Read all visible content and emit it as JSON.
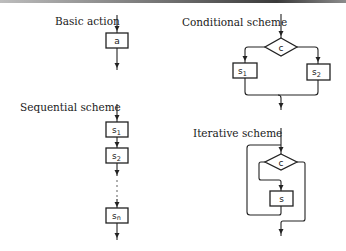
{
  "diagram": {
    "basic_action": {
      "title": "Basic action",
      "box_label": "a"
    },
    "conditional_scheme": {
      "title": "Conditional scheme",
      "condition_label": "c",
      "left_box": {
        "base": "s",
        "sub": "1"
      },
      "right_box": {
        "base": "s",
        "sub": "2"
      }
    },
    "sequential_scheme": {
      "title": "Sequential scheme",
      "boxes": [
        {
          "base": "s",
          "sub": "1"
        },
        {
          "base": "s",
          "sub": "2"
        },
        {
          "base": "s",
          "sub": "n"
        }
      ],
      "ellipsis": "⋮"
    },
    "iterative_scheme": {
      "title": "Iterative scheme",
      "condition_label": "c",
      "body_label": "s"
    }
  },
  "colors": {
    "line": "#222222",
    "text": "#1a1a1a",
    "background": "#ffffff"
  }
}
